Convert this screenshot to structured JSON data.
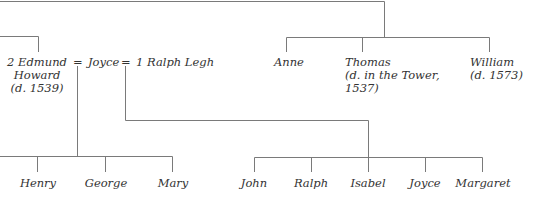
{
  "parents": {
    "edmund": {
      "name": "2 Edmund",
      "name2": "Howard",
      "note": "(d. 1539)"
    },
    "eq1": "=",
    "joyce": {
      "name": "Joyce"
    },
    "eq2": "=",
    "ralph": {
      "name": "1 Ralph Legh"
    }
  },
  "siblings": [
    {
      "name": "Anne"
    },
    {
      "name": "Thomas",
      "note": "(d. in the Tower,",
      "note2": "1537)"
    },
    {
      "name": "William",
      "note": "(d. 1573)"
    }
  ],
  "howard_children": [
    {
      "name": "Henry"
    },
    {
      "name": "George"
    },
    {
      "name": "Mary"
    }
  ],
  "legh_children": [
    {
      "name": "John"
    },
    {
      "name": "Ralph"
    },
    {
      "name": "Isabel"
    },
    {
      "name": "Joyce"
    },
    {
      "name": "Margaret"
    }
  ]
}
